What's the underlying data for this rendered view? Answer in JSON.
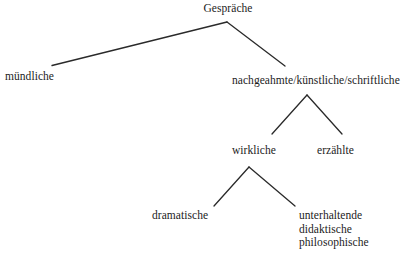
{
  "diagram": {
    "type": "tree",
    "title_text": "",
    "background_color": "#ffffff",
    "line_color": "#2a2a2a",
    "text_color": "#1c1c1c",
    "nodes": {
      "root": "Gespräche",
      "oral": "mündliche",
      "written": "nachgeahmte/künstliche/schriftliche",
      "real": "wirkliche",
      "narrated": "erzählte",
      "dramatic": "dramatische",
      "entertaining": "unterhaltende",
      "didactic": "didaktische",
      "philosophical": "philosophische"
    }
  }
}
